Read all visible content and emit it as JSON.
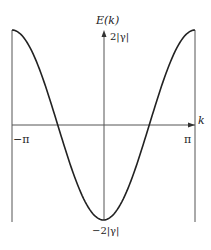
{
  "chart_data": {
    "type": "line",
    "title": "",
    "xlabel": "k",
    "ylabel": "E(k)",
    "x_ticks": [
      "−π",
      "π"
    ],
    "y_ticks": [
      "2|γ|",
      "−2|γ|"
    ],
    "xlim": [
      -3.1416,
      3.1416
    ],
    "ylim": [
      -2,
      2
    ],
    "series": [
      {
        "name": "E(k) = −2|γ|cos k",
        "x": [
          -3.1416,
          -2.356,
          -1.571,
          -0.785,
          0,
          0.785,
          1.571,
          2.356,
          3.1416
        ],
        "values": [
          2,
          1.414,
          0,
          -1.414,
          -2,
          -1.414,
          0,
          1.414,
          2
        ]
      }
    ],
    "grid": false,
    "legend": "none"
  },
  "labels": {
    "y_axis": "E(k)",
    "y_top": "2|γ|",
    "y_bottom": "−2|γ|",
    "x_axis": "k",
    "x_left": "−π",
    "x_right": "π"
  }
}
